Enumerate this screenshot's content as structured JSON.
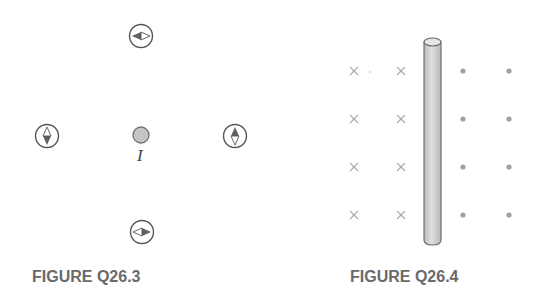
{
  "figures": [
    {
      "caption": "FIGURE Q26.3",
      "wire": {
        "label": "I",
        "fill": "#c4c4c4",
        "stroke": "#707070"
      },
      "compasses": [
        {
          "position": "top",
          "north_direction": "left"
        },
        {
          "position": "left",
          "north_direction": "down"
        },
        {
          "position": "right",
          "north_direction": "up"
        },
        {
          "position": "bottom",
          "north_direction": "right"
        }
      ]
    },
    {
      "caption": "FIGURE Q26.4",
      "wire": {
        "orientation": "vertical",
        "fill": "#d4d4d4"
      },
      "field_left_symbol": "×",
      "field_right_symbol": "•",
      "field_rows": 4,
      "field_columns_each_side": 2
    }
  ],
  "colors": {
    "caption": "#6a6a6a",
    "symbol": "#a0a0a0",
    "compass_ring": "#555555",
    "needle_dark": "#606060"
  }
}
